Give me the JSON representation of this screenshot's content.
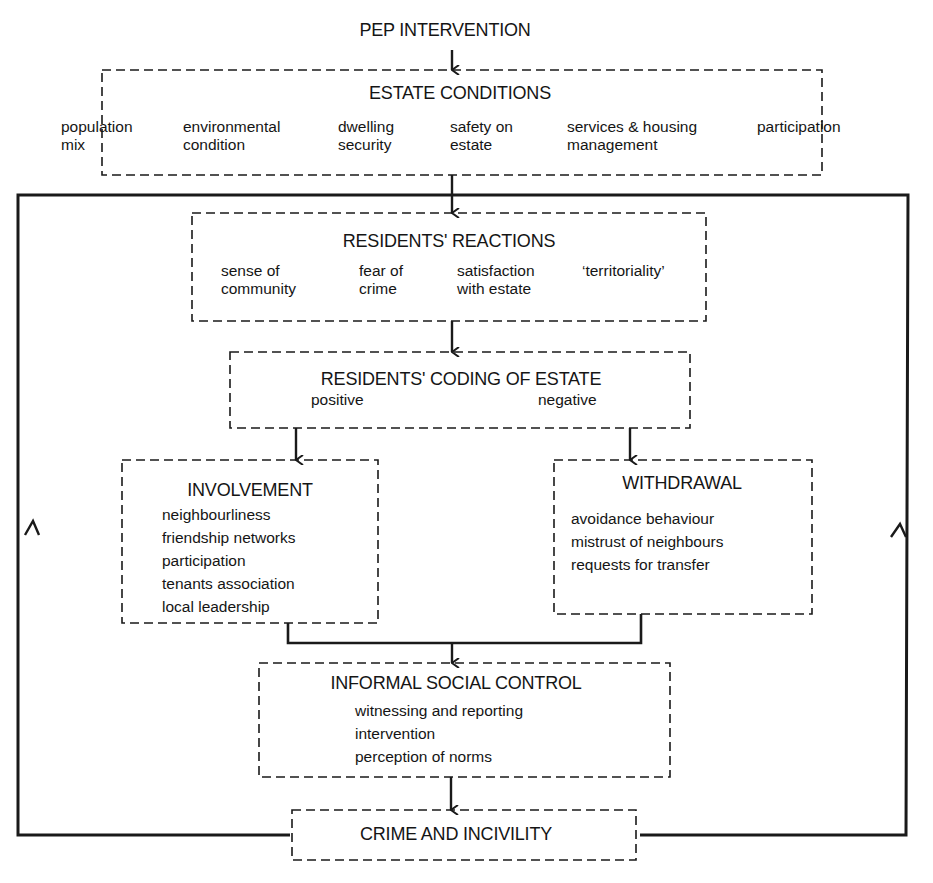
{
  "diagram": {
    "top_label": "PEP INTERVENTION",
    "estate_conditions": {
      "title": "ESTATE CONDITIONS",
      "items": [
        "population\nmix",
        "environmental\ncondition",
        "dwelling\nsecurity",
        "safety on\nestate",
        "services & housing\nmanagement",
        "participation"
      ]
    },
    "residents_reactions": {
      "title": "RESIDENTS' REACTIONS",
      "items": [
        "sense of\ncommunity",
        "fear of\ncrime",
        "satisfaction\nwith estate",
        "‘territoriality’"
      ]
    },
    "residents_coding": {
      "title": "RESIDENTS' CODING OF ESTATE",
      "positive": "positive",
      "negative": "negative"
    },
    "involvement": {
      "title": "INVOLVEMENT",
      "items": [
        "neighbourliness",
        "friendship networks",
        "participation",
        "tenants association",
        "local leadership"
      ]
    },
    "withdrawal": {
      "title": "WITHDRAWAL",
      "items": [
        "avoidance behaviour",
        "mistrust of neighbours",
        "requests for transfer"
      ]
    },
    "informal_social_control": {
      "title": "INFORMAL SOCIAL CONTROL",
      "items": [
        "witnessing and reporting",
        "intervention",
        "perception of norms"
      ]
    },
    "crime_and_incivility": {
      "title": "CRIME AND INCIVILITY"
    },
    "colors": {
      "line": "#1a1a1a",
      "background": "#ffffff"
    }
  }
}
